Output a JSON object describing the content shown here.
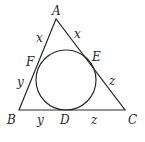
{
  "diagram": {
    "vertices": {
      "A": {
        "label": "A"
      },
      "B": {
        "label": "B"
      },
      "C": {
        "label": "C"
      }
    },
    "tangent_points": {
      "D": {
        "label": "D",
        "side": "BC"
      },
      "E": {
        "label": "E",
        "side": "AC"
      },
      "F": {
        "label": "F",
        "side": "AB"
      }
    },
    "segment_labels": {
      "AF": "x",
      "AE": "x",
      "BF": "y",
      "BD": "y",
      "CE": "z",
      "CD": "z"
    },
    "colors": {
      "stroke": "#2a2a2a",
      "background": "#ffffff"
    }
  }
}
